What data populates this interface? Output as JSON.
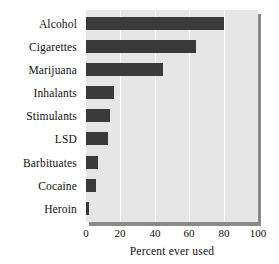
{
  "chart_data": {
    "type": "bar",
    "orientation": "horizontal",
    "title": "",
    "xlabel": "Percent ever used",
    "ylabel": "",
    "categories": [
      "Alcohol",
      "Cigarettes",
      "Marijuana",
      "Inhalants",
      "Stimulants",
      "LSD",
      "Barbituates",
      "Cocaine",
      "Heroin"
    ],
    "values": [
      80,
      64,
      45,
      16,
      14,
      13,
      7,
      6,
      1.5
    ],
    "xlim": [
      0,
      100
    ],
    "xticks": [
      0,
      20,
      40,
      60,
      80,
      100
    ],
    "xtick_labels": [
      "0",
      "20",
      "40",
      "60",
      "80",
      "100"
    ],
    "grid": "vertical",
    "legend": "none",
    "series": [
      {
        "name": "Percent ever used",
        "values": [
          80,
          64,
          45,
          16,
          14,
          13,
          7,
          6,
          1.5
        ]
      }
    ]
  },
  "colors": {
    "bar": "#3a3a3a",
    "plot_background": "#e6e6e6",
    "gridline": "#fbfbfb",
    "shadow": "#8a8a8a",
    "text": "#111111",
    "page_background": "#ffffff"
  }
}
